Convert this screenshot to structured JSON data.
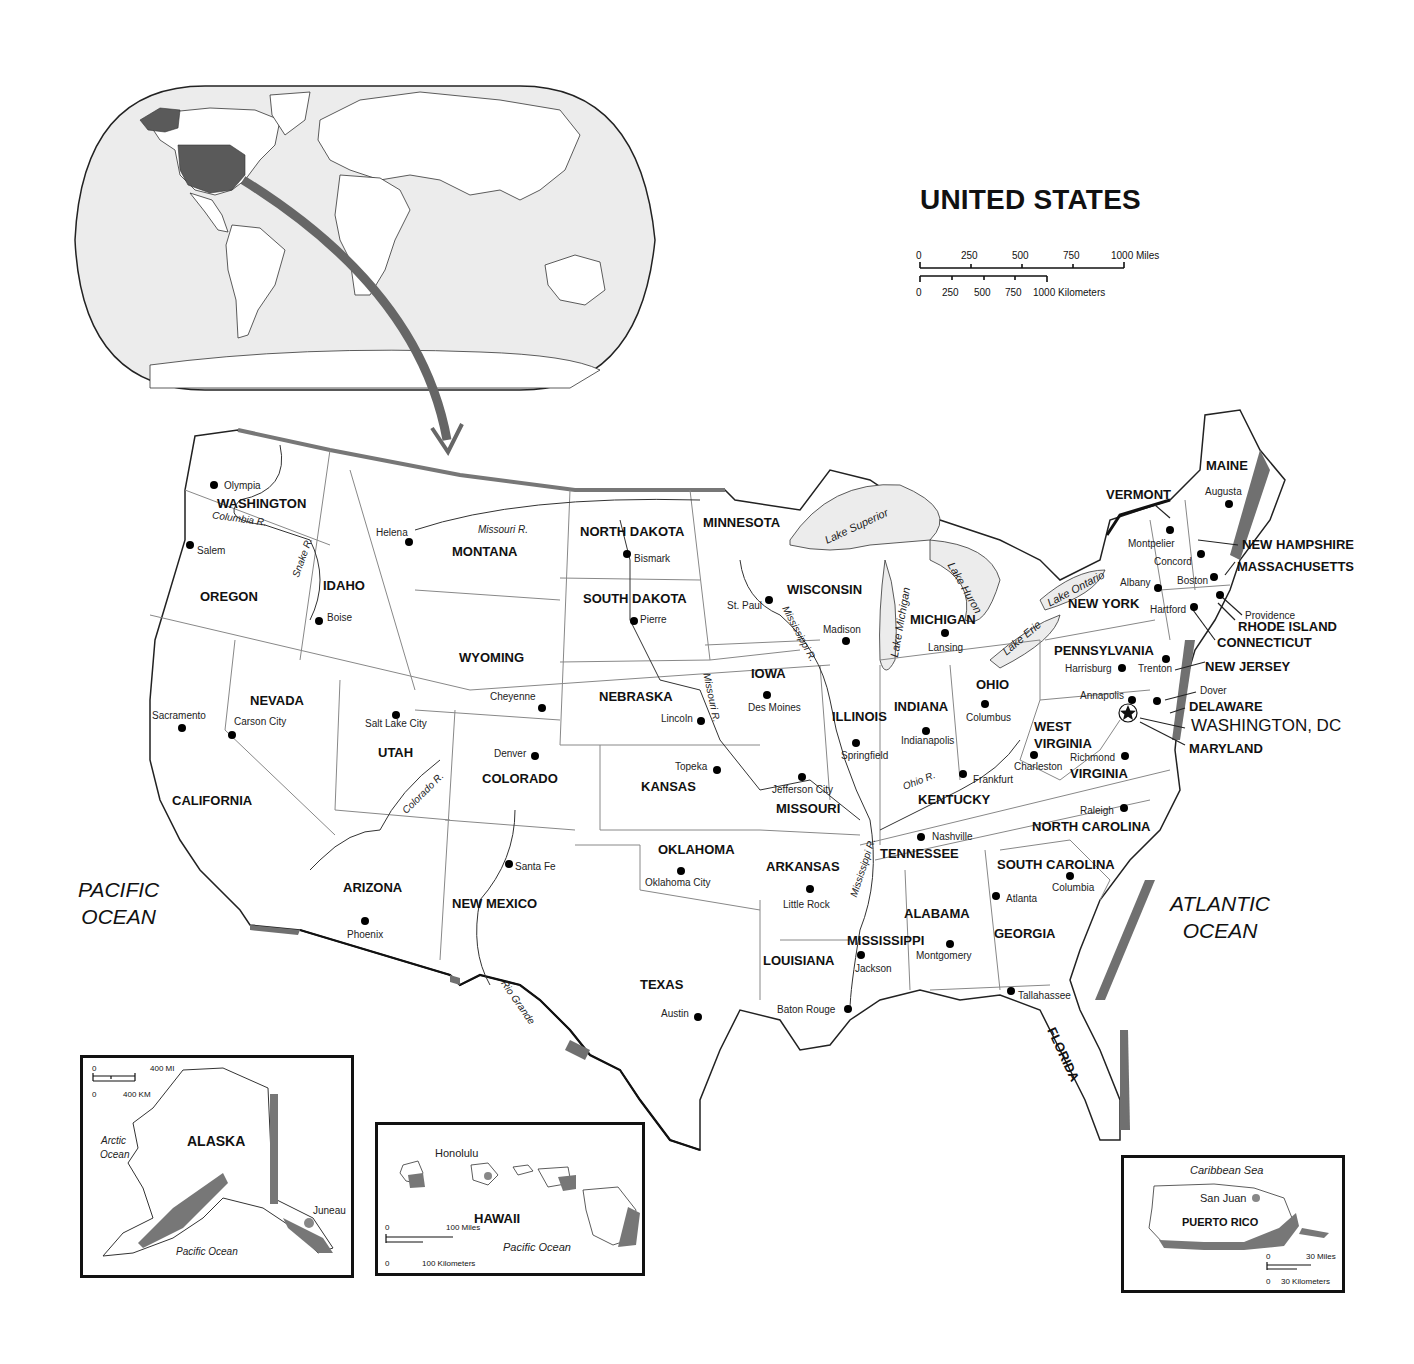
{
  "title": "UNITED STATES",
  "scale": {
    "miles": {
      "ticks": [
        "0",
        "250",
        "500",
        "750",
        "1000 Miles"
      ]
    },
    "kilometers": {
      "ticks": [
        "0",
        "250",
        "500",
        "750",
        "1000 Kilometers"
      ]
    }
  },
  "oceans": {
    "pacific": {
      "line1": "PACIFIC",
      "line2": "OCEAN"
    },
    "atlantic": {
      "line1": "ATLANTIC",
      "line2": "OCEAN"
    }
  },
  "states": {
    "washington": "WASHINGTON",
    "oregon": "OREGON",
    "california": "CALIFORNIA",
    "idaho": "IDAHO",
    "nevada": "NEVADA",
    "montana": "MONTANA",
    "wyoming": "WYOMING",
    "utah": "UTAH",
    "colorado": "COLORADO",
    "arizona": "ARIZONA",
    "new_mexico": "NEW MEXICO",
    "north_dakota": "NORTH DAKOTA",
    "south_dakota": "SOUTH DAKOTA",
    "nebraska": "NEBRASKA",
    "kansas": "KANSAS",
    "oklahoma": "OKLAHOMA",
    "texas": "TEXAS",
    "minnesota": "MINNESOTA",
    "iowa": "IOWA",
    "missouri": "MISSOURI",
    "arkansas": "ARKANSAS",
    "louisiana": "LOUISIANA",
    "wisconsin": "WISCONSIN",
    "illinois": "ILLINOIS",
    "michigan": "MICHIGAN",
    "indiana": "INDIANA",
    "ohio": "OHIO",
    "kentucky": "KENTUCKY",
    "tennessee": "TENNESSEE",
    "mississippi": "MISSISSIPPI",
    "alabama": "ALABAMA",
    "georgia": "GEORGIA",
    "florida": "FLORIDA",
    "south_carolina": "SOUTH CAROLINA",
    "north_carolina": "NORTH CAROLINA",
    "virginia": "VIRGINIA",
    "west_virginia_1": "WEST",
    "west_virginia_2": "VIRGINIA",
    "pennsylvania": "PENNSYLVANIA",
    "new_york": "NEW YORK",
    "vermont": "VERMONT",
    "new_hampshire": "NEW HAMPSHIRE",
    "maine": "MAINE",
    "massachusetts": "MASSACHUSETTS",
    "rhode_island": "RHODE ISLAND",
    "connecticut": "CONNECTICUT",
    "new_jersey": "NEW JERSEY",
    "delaware": "DELAWARE",
    "maryland": "MARYLAND",
    "washington_dc": "WASHINGTON, DC"
  },
  "capitals": {
    "olympia": "Olympia",
    "salem": "Salem",
    "sacramento": "Sacramento",
    "boise": "Boise",
    "carson_city": "Carson City",
    "helena": "Helena",
    "cheyenne": "Cheyenne",
    "salt_lake_city": "Salt Lake City",
    "denver": "Denver",
    "phoenix": "Phoenix",
    "santa_fe": "Santa Fe",
    "bismark": "Bismark",
    "pierre": "Pierre",
    "lincoln": "Lincoln",
    "topeka": "Topeka",
    "oklahoma_city": "Oklahoma City",
    "austin": "Austin",
    "st_paul": "St. Paul",
    "des_moines": "Des Moines",
    "jefferson_city": "Jefferson City",
    "little_rock": "Little Rock",
    "baton_rouge": "Baton Rouge",
    "madison": "Madison",
    "springfield": "Springfield",
    "lansing": "Lansing",
    "indianapolis": "Indianapolis",
    "columbus_oh": "Columbus",
    "frankfurt": "Frankfurt",
    "nashville": "Nashville",
    "jackson": "Jackson",
    "montgomery": "Montgomery",
    "atlanta": "Atlanta",
    "tallahassee": "Tallahassee",
    "columbia": "Columbia",
    "raleigh": "Raleigh",
    "richmond": "Richmond",
    "charleston": "Charleston",
    "harrisburg": "Harrisburg",
    "trenton": "Trenton",
    "albany": "Albany",
    "montpelier": "Montpelier",
    "concord": "Concord",
    "augusta": "Augusta",
    "boston": "Boston",
    "providence": "Providence",
    "hartford": "Hartford",
    "dover": "Dover",
    "annapolis": "Annapolis"
  },
  "rivers": {
    "columbia": "Columbia R.",
    "snake": "Snake R.",
    "missouri_mt": "Missouri R.",
    "missouri_ne": "Missouri R.",
    "mississippi_wi": "Mississippi R.",
    "mississippi_ar": "Mississippi R.",
    "ohio": "Ohio R.",
    "colorado": "Colorado R.",
    "rio_grande": "Rio Grande"
  },
  "lakes": {
    "superior": "Lake Superior",
    "michigan": "Lake Michigan",
    "huron": "Lake Huron",
    "erie": "Lake Erie",
    "ontario": "Lake Ontario"
  },
  "insets": {
    "alaska": {
      "name": "ALASKA",
      "capital": "Juneau",
      "arctic_1": "Arctic",
      "arctic_2": "Ocean",
      "pacific": "Pacific Ocean",
      "scale_mi": [
        "0",
        "400 MI"
      ],
      "scale_km": [
        "0",
        "400 KM"
      ]
    },
    "hawaii": {
      "name": "HAWAII",
      "capital": "Honolulu",
      "pacific": "Pacific Ocean",
      "scale_mi": [
        "0",
        "100 Miles"
      ],
      "scale_km": [
        "0",
        "100 Kilometers"
      ]
    },
    "puerto_rico": {
      "name": "PUERTO RICO",
      "capital": "San Juan",
      "sea": "Caribbean Sea",
      "scale_mi": [
        "0",
        "30 Miles"
      ],
      "scale_km": [
        "0",
        "30 Kilometers"
      ]
    }
  },
  "colors": {
    "water": "#ececec",
    "highlight": "#5a5a5a",
    "border": "#888888",
    "coast_shadow": "#707070"
  }
}
